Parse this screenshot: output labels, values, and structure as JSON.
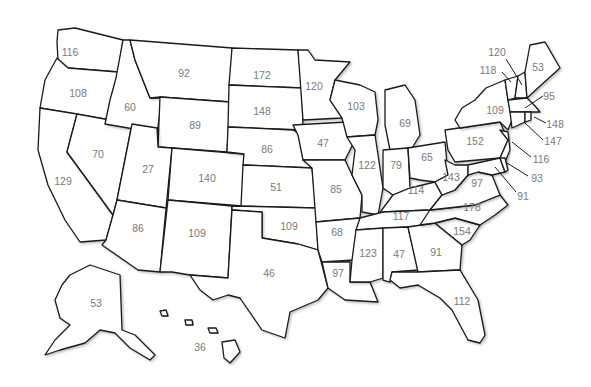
{
  "map": {
    "title": "",
    "states": [
      {
        "abbr": "WA",
        "name": "Washington",
        "value": "116",
        "x": 70,
        "y": 53
      },
      {
        "abbr": "OR",
        "name": "Oregon",
        "value": "108",
        "x": 78,
        "y": 94
      },
      {
        "abbr": "CA",
        "name": "California",
        "value": "129",
        "x": 63,
        "y": 182
      },
      {
        "abbr": "NV",
        "name": "Nevada",
        "value": "70",
        "x": 98,
        "y": 155
      },
      {
        "abbr": "ID",
        "name": "Idaho",
        "value": "60",
        "x": 130,
        "y": 108
      },
      {
        "abbr": "MT",
        "name": "Montana",
        "value": "92",
        "x": 184,
        "y": 74
      },
      {
        "abbr": "WY",
        "name": "Wyoming",
        "value": "89",
        "x": 195,
        "y": 126
      },
      {
        "abbr": "UT",
        "name": "Utah",
        "value": "27",
        "x": 148,
        "y": 170
      },
      {
        "abbr": "CO",
        "name": "Colorado",
        "value": "140",
        "x": 207,
        "y": 179
      },
      {
        "abbr": "AZ",
        "name": "Arizona",
        "value": "86",
        "x": 138,
        "y": 229
      },
      {
        "abbr": "NM",
        "name": "New Mexico",
        "value": "109",
        "x": 197,
        "y": 234
      },
      {
        "abbr": "ND",
        "name": "North Dakota",
        "value": "172",
        "x": 262,
        "y": 76
      },
      {
        "abbr": "SD",
        "name": "South Dakota",
        "value": "148",
        "x": 262,
        "y": 112
      },
      {
        "abbr": "NE",
        "name": "Nebraska",
        "value": "86",
        "x": 267,
        "y": 150
      },
      {
        "abbr": "KS",
        "name": "Kansas",
        "value": "51",
        "x": 276,
        "y": 188
      },
      {
        "abbr": "OK",
        "name": "Oklahoma",
        "value": "109",
        "x": 289,
        "y": 227
      },
      {
        "abbr": "TX",
        "name": "Texas",
        "value": "46",
        "x": 269,
        "y": 274
      },
      {
        "abbr": "MN",
        "name": "Minnesota",
        "value": "120",
        "x": 314,
        "y": 87
      },
      {
        "abbr": "IA",
        "name": "Iowa",
        "value": "47",
        "x": 323,
        "y": 144
      },
      {
        "abbr": "MO",
        "name": "Missouri",
        "value": "85",
        "x": 336,
        "y": 190
      },
      {
        "abbr": "AR",
        "name": "Arkansas",
        "value": "68",
        "x": 337,
        "y": 233
      },
      {
        "abbr": "LA",
        "name": "Louisiana",
        "value": "97",
        "x": 338,
        "y": 274
      },
      {
        "abbr": "WI",
        "name": "Wisconsin",
        "value": "103",
        "x": 356,
        "y": 107
      },
      {
        "abbr": "IL",
        "name": "Illinois",
        "value": "122",
        "x": 367,
        "y": 166
      },
      {
        "abbr": "MI",
        "name": "Michigan",
        "value": "69",
        "x": 405,
        "y": 124
      },
      {
        "abbr": "IN",
        "name": "Indiana",
        "value": "79",
        "x": 396,
        "y": 166
      },
      {
        "abbr": "OH",
        "name": "Ohio",
        "value": "65",
        "x": 427,
        "y": 158
      },
      {
        "abbr": "KY",
        "name": "Kentucky",
        "value": "114",
        "x": 416,
        "y": 191
      },
      {
        "abbr": "TN",
        "name": "Tennessee",
        "value": "117",
        "x": 401,
        "y": 217
      },
      {
        "abbr": "MS",
        "name": "Mississippi",
        "value": "123",
        "x": 368,
        "y": 254
      },
      {
        "abbr": "AL",
        "name": "Alabama",
        "value": "47",
        "x": 399,
        "y": 255
      },
      {
        "abbr": "GA",
        "name": "Georgia",
        "value": "91",
        "x": 436,
        "y": 253
      },
      {
        "abbr": "FL",
        "name": "Florida",
        "value": "112",
        "x": 462,
        "y": 302
      },
      {
        "abbr": "SC",
        "name": "South Carolina",
        "value": "154",
        "x": 462,
        "y": 232
      },
      {
        "abbr": "NC",
        "name": "North Carolina",
        "value": "178",
        "x": 472,
        "y": 208
      },
      {
        "abbr": "VA",
        "name": "Virginia",
        "value": "97",
        "x": 477,
        "y": 184
      },
      {
        "abbr": "WV",
        "name": "West Virginia",
        "value": "143",
        "x": 451,
        "y": 178
      },
      {
        "abbr": "PA",
        "name": "Pennsylvania",
        "value": "152",
        "x": 475,
        "y": 142
      },
      {
        "abbr": "NY",
        "name": "New York",
        "value": "109",
        "x": 495,
        "y": 111
      },
      {
        "abbr": "ME",
        "name": "Maine",
        "value": "53",
        "x": 538,
        "y": 68
      },
      {
        "abbr": "AK",
        "name": "Alaska",
        "value": "53",
        "x": 96,
        "y": 304
      },
      {
        "abbr": "HI",
        "name": "Hawaii",
        "value": "36",
        "x": 200,
        "y": 348
      }
    ],
    "callouts": [
      {
        "abbr": "VT",
        "name": "Vermont",
        "value": "118",
        "x": 488,
        "y": 71,
        "lx1": 502,
        "ly1": 72,
        "lx2": 511,
        "ly2": 82
      },
      {
        "abbr": "NH",
        "name": "New Hampshire",
        "value": "120",
        "x": 497,
        "y": 53,
        "lx1": 506,
        "ly1": 59,
        "lx2": 522,
        "ly2": 85
      },
      {
        "abbr": "MA",
        "name": "Massachusetts",
        "value": "95",
        "x": 549,
        "y": 97,
        "lx1": 543,
        "ly1": 96,
        "lx2": 525,
        "ly2": 108
      },
      {
        "abbr": "RI",
        "name": "Rhode Island",
        "value": "148",
        "x": 555,
        "y": 125,
        "lx1": 546,
        "ly1": 123,
        "lx2": 534,
        "ly2": 117
      },
      {
        "abbr": "CT",
        "name": "Connecticut",
        "value": "147",
        "x": 553,
        "y": 142,
        "lx1": 543,
        "ly1": 140,
        "lx2": 524,
        "ly2": 122
      },
      {
        "abbr": "NJ",
        "name": "New Jersey",
        "value": "116",
        "x": 541,
        "y": 160,
        "lx1": 531,
        "ly1": 157,
        "lx2": 512,
        "ly2": 142
      },
      {
        "abbr": "DE",
        "name": "Delaware",
        "value": "93",
        "x": 537,
        "y": 179,
        "lx1": 528,
        "ly1": 176,
        "lx2": 507,
        "ly2": 163
      },
      {
        "abbr": "MD",
        "name": "Maryland",
        "value": "91",
        "x": 523,
        "y": 197,
        "lx1": 516,
        "ly1": 192,
        "lx2": 495,
        "ly2": 167
      }
    ]
  }
}
